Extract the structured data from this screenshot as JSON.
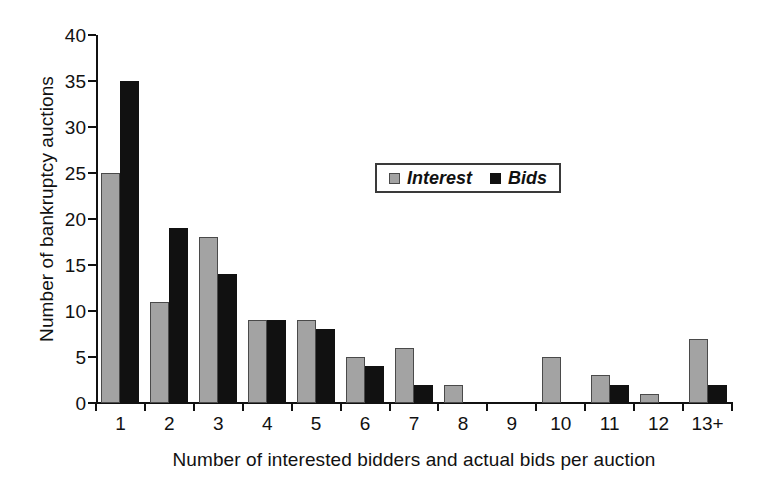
{
  "chart_data": {
    "type": "bar",
    "title": "",
    "subtitle": "",
    "xlabel": "Number of interested bidders and actual bids per auction",
    "ylabel": "Number of bankruptcy auctions",
    "categories": [
      "1",
      "2",
      "3",
      "4",
      "5",
      "6",
      "7",
      "8",
      "9",
      "10",
      "11",
      "12",
      "13+"
    ],
    "series": [
      {
        "name": "Interest",
        "color": "#a3a3a3",
        "values": [
          25,
          11,
          18,
          9,
          9,
          5,
          6,
          2,
          0,
          5,
          3,
          1,
          7
        ]
      },
      {
        "name": "Bids",
        "color": "#111111",
        "values": [
          35,
          19,
          14,
          9,
          8,
          4,
          2,
          0,
          0,
          0,
          2,
          0,
          2
        ]
      }
    ],
    "ylim": [
      0,
      40
    ],
    "yticks": [
      0,
      5,
      10,
      15,
      20,
      25,
      30,
      35,
      40
    ],
    "ytick_labels": [
      "0",
      "5",
      "10",
      "15",
      "20",
      "25",
      "30",
      "35",
      "40"
    ],
    "grid": false,
    "legend_position": "upper-center-right",
    "legend_entries": [
      "Interest",
      "Bids"
    ]
  }
}
